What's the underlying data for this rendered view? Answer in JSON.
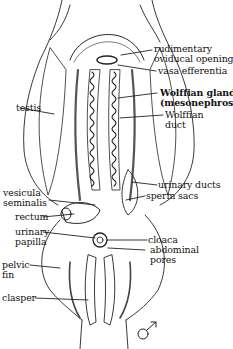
{
  "figure": {
    "sex_symbol": "♂"
  },
  "labels": {
    "rudimentary_oviducal_opening": "rudimentary\noviducal opening",
    "vasa_efferentia": "vasa efferentia",
    "testis": "testis",
    "wolffian_gland": "Wolffian gland\n(mesonephros)",
    "wolffian_duct": "Wolffian\nduct",
    "vesicula_seminalis": "vesicula\nseminalis",
    "urinary_ducts": "urinary ducts",
    "rectum": "rectum",
    "sperm_sacs": "sperm sacs",
    "urinary_papilla": "urinary\npapilla",
    "cloaca": "cloaca",
    "abdominal_pores": "abdominal\npores",
    "pelvic_fin": "pelvic\nfin",
    "clasper": "clasper"
  },
  "colors": {
    "ink": "#111111",
    "paper": "#ffffff"
  }
}
